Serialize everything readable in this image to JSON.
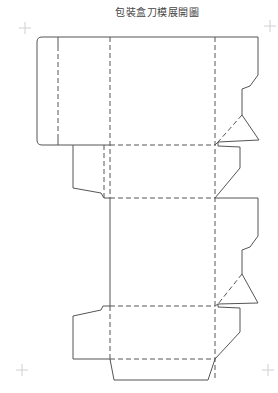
{
  "title": "包裝盒刀模展開圖",
  "colors": {
    "cut_line": "#555555",
    "fold_line": "#555555",
    "registration_mark": "#d0d0d0",
    "title_text": "#444444",
    "background": "#ffffff"
  },
  "legend": {
    "cut_line_style": "solid",
    "fold_line_style": "dashed"
  },
  "registration_marks": [
    {
      "position": "top-left",
      "x": 25,
      "y": 28
    },
    {
      "position": "top-right",
      "x": 270,
      "y": 26
    },
    {
      "position": "bottom-left",
      "x": 22,
      "y": 370
    },
    {
      "position": "bottom-right",
      "x": 268,
      "y": 370
    }
  ],
  "panels": [
    {
      "name": "glue-flap",
      "x1": 37,
      "x2": 58,
      "y1": 37,
      "y2": 145
    },
    {
      "name": "side-panel-top",
      "x1": 58,
      "x2": 110,
      "y1": 37,
      "y2": 145
    },
    {
      "name": "front-panel",
      "x1": 110,
      "x2": 215,
      "y1": 37,
      "y2": 145
    },
    {
      "name": "top-lid",
      "x1": 110,
      "x2": 215,
      "y1": 145,
      "y2": 198
    },
    {
      "name": "back-panel",
      "x1": 110,
      "x2": 215,
      "y1": 198,
      "y2": 306
    },
    {
      "name": "bottom-panel",
      "x1": 110,
      "x2": 215,
      "y1": 306,
      "y2": 359
    },
    {
      "name": "tuck-flap",
      "x1": 110,
      "x2": 215,
      "y1": 359,
      "y2": 380
    }
  ]
}
